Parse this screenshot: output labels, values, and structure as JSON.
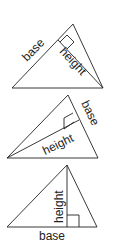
{
  "diagrams": [
    {
      "id": "triangle-1",
      "base_label": "base",
      "height_label": "height"
    },
    {
      "id": "triangle-2",
      "base_label": "base",
      "height_label": "height"
    },
    {
      "id": "triangle-3",
      "base_label": "base",
      "height_label": "height"
    }
  ],
  "colors": {
    "line": "#222222",
    "background": "#ffffff"
  }
}
